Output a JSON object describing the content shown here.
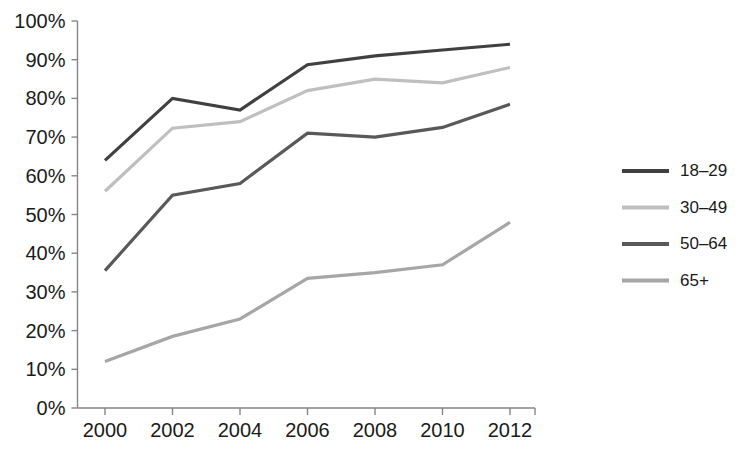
{
  "chart_data": {
    "type": "line",
    "title": "",
    "subtitle": "",
    "xlabel": "",
    "ylabel": "",
    "x": [
      2000,
      2002,
      2004,
      2006,
      2008,
      2010,
      2012
    ],
    "categories": [
      "2000",
      "2002",
      "2004",
      "2006",
      "2008",
      "2010",
      "2012"
    ],
    "xtick_labels": [
      "2000",
      "2002",
      "2004",
      "2006",
      "2008",
      "2010",
      "2012"
    ],
    "ytick_labels": [
      "0%",
      "10%",
      "20%",
      "30%",
      "40%",
      "50%",
      "60%",
      "70%",
      "80%",
      "90%",
      "100%"
    ],
    "ytick_values": [
      0,
      10,
      20,
      30,
      40,
      50,
      60,
      70,
      80,
      90,
      100
    ],
    "ylim": [
      0,
      100
    ],
    "xlim": [
      2000,
      2012
    ],
    "grid": false,
    "legend_position": "right",
    "unit": "%",
    "series": [
      {
        "name": "18–29",
        "color": "#404040",
        "values": [
          64,
          80,
          77,
          88.7,
          91,
          92.5,
          94
        ]
      },
      {
        "name": "30–49",
        "color": "#bfbfbf",
        "values": [
          56,
          72.3,
          74,
          82,
          85,
          84,
          88
        ]
      },
      {
        "name": "50–64",
        "color": "#595959",
        "values": [
          35.5,
          55,
          58,
          71,
          70,
          72.5,
          78.5
        ]
      },
      {
        "name": "65+",
        "color": "#a6a6a6",
        "values": [
          12,
          18.5,
          23,
          33.5,
          35,
          37,
          48
        ]
      }
    ]
  },
  "legend": {
    "items": [
      {
        "label": "18–29",
        "color": "#404040"
      },
      {
        "label": "30–49",
        "color": "#bfbfbf"
      },
      {
        "label": "50–64",
        "color": "#595959"
      },
      {
        "label": "65+",
        "color": "#a6a6a6"
      }
    ]
  },
  "axes": {
    "y_axis_color": "#868686",
    "x_axis_color": "#868686"
  }
}
